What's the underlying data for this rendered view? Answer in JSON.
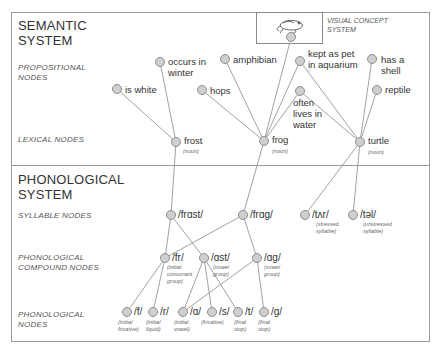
{
  "semantic": {
    "title_line1": "SEMANTIC",
    "title_line2": "SYSTEM",
    "levels": {
      "propositional_line1": "PROPOSITIONAL",
      "propositional_line2": "NODES",
      "lexical": "LEXICAL NODES"
    },
    "visual_concept": {
      "label_line1": "VISUAL CONCEPT",
      "label_line2": "SYSTEM",
      "icon": "frog-icon"
    },
    "propositions": [
      {
        "id": "is_white",
        "label_line1": "is white",
        "label_line2": ""
      },
      {
        "id": "occurs_in_winter",
        "label_line1": "occurs in",
        "label_line2": "winter"
      },
      {
        "id": "amphibian",
        "label_line1": "amphibian",
        "label_line2": ""
      },
      {
        "id": "hops",
        "label_line1": "hops",
        "label_line2": ""
      },
      {
        "id": "kept_as_pet",
        "label_line1": "kept as pet",
        "label_line2": "in aquarium"
      },
      {
        "id": "often_lives",
        "label_line1": "often",
        "label_line2": "lives in",
        "label_line3": "water"
      },
      {
        "id": "has_a_shell",
        "label_line1": "has a",
        "label_line2": "shell"
      },
      {
        "id": "reptile",
        "label_line1": "reptile",
        "label_line2": ""
      }
    ],
    "lexical": [
      {
        "id": "frost",
        "label": "frost",
        "pos": "(noun)"
      },
      {
        "id": "frog",
        "label": "frog",
        "pos": "(noun)"
      },
      {
        "id": "turtle",
        "label": "turtle",
        "pos": "(noun)"
      }
    ]
  },
  "phonological": {
    "title_line1": "PHONOLOGICAL",
    "title_line2": "SYSTEM",
    "levels": {
      "syllable": "SYLLABLE NODES",
      "compound_line1": "PHONOLOGICAL",
      "compound_line2": "COMPOUND NODES",
      "phon_line1": "PHONOLOGICAL",
      "phon_line2": "NODES"
    },
    "syllables": [
      {
        "id": "frast",
        "label": "/frɑst/",
        "sub_line1": "",
        "sub_line2": ""
      },
      {
        "id": "frag",
        "label": "/frɑg/",
        "sub_line1": "",
        "sub_line2": ""
      },
      {
        "id": "tar",
        "label": "/tʌr/",
        "sub_line1": "(stressed",
        "sub_line2": "syllable)"
      },
      {
        "id": "tal",
        "label": "/təl/",
        "sub_line1": "(unstressed",
        "sub_line2": "syllable)"
      }
    ],
    "compounds": [
      {
        "id": "fr",
        "label": "/fr/",
        "sub_line1": "(initial",
        "sub_line2": "consonant",
        "sub_line3": "group)"
      },
      {
        "id": "ast",
        "label": "/ɑst/",
        "sub_line1": "(vowel",
        "sub_line2": "group)",
        "sub_line3": ""
      },
      {
        "id": "ag",
        "label": "/ɑg/",
        "sub_line1": "(vowel",
        "sub_line2": "group)",
        "sub_line3": ""
      }
    ],
    "phonemes": [
      {
        "id": "f",
        "label": "/f/",
        "sub_line1": "(initial",
        "sub_line2": "fricative)"
      },
      {
        "id": "r",
        "label": "/r/",
        "sub_line1": "(initial",
        "sub_line2": "liquid)"
      },
      {
        "id": "a",
        "label": "/ɑ/",
        "sub_line1": "(initial",
        "sub_line2": "vowel)"
      },
      {
        "id": "s",
        "label": "/s/",
        "sub_line1": "(fricative)",
        "sub_line2": ""
      },
      {
        "id": "t",
        "label": "/t/",
        "sub_line1": "(final",
        "sub_line2": "stop)"
      },
      {
        "id": "g",
        "label": "/g/",
        "sub_line1": "(final",
        "sub_line2": "stop)"
      }
    ]
  },
  "colors": {
    "node_fill": "#cfcfcf",
    "node_stroke": "#8f8f8f",
    "edge": "#8a8a8a",
    "border": "#9a9a9a"
  }
}
